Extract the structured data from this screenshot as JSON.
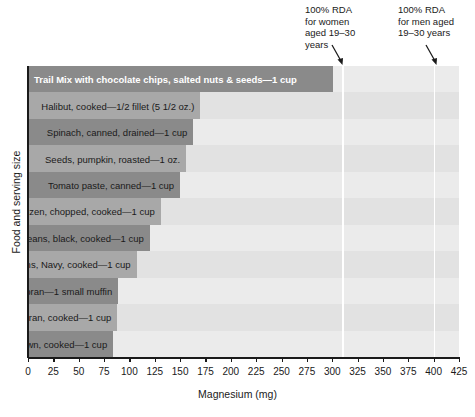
{
  "chart_data": {
    "type": "bar",
    "orientation": "horizontal",
    "title": "",
    "xlabel": "Magnesium (mg)",
    "ylabel": "Food and serving size",
    "xlim": [
      0,
      425
    ],
    "xticks": [
      0,
      25,
      50,
      75,
      100,
      125,
      150,
      175,
      200,
      225,
      250,
      275,
      300,
      325,
      350,
      375,
      400,
      425
    ],
    "grid": false,
    "legend": "none",
    "categories": [
      "Trail Mix with chocolate chips, salted nuts & seeds—1 cup",
      "Halibut, cooked—1/2 fillet (5 1/2 oz.)",
      "Spinach, canned, drained—1 cup",
      "Seeds, pumpkin, roasted—1 oz.",
      "Tomato paste, canned—1 cup",
      "Spinach, frozen, chopped, cooked—1 cup",
      "Beans, black, cooked—1 cup",
      "Beans, Navy, cooked—1 cup",
      "Muffins, oat bran—1 small muffin",
      "Oat bran, cooked—1 cup",
      "Rice, brown, cooked—1 cup"
    ],
    "values": [
      301,
      170,
      163,
      156,
      150,
      131,
      120,
      107,
      89,
      88,
      84
    ],
    "bar_colors": [
      "dark",
      "light",
      "dark",
      "light",
      "dark",
      "light",
      "dark",
      "light",
      "dark",
      "light",
      "dark"
    ],
    "label_placement": [
      "inside",
      "outside",
      "outside",
      "outside",
      "outside",
      "outside",
      "outside",
      "outside",
      "outside",
      "outside",
      "outside"
    ],
    "annotations": [
      {
        "id": "rda-women",
        "text": "100% RDA\nfor women\naged 19–30\nyears",
        "value": 310
      },
      {
        "id": "rda-men",
        "text": "100% RDA\nfor men aged\n19–30 years",
        "value": 400
      }
    ]
  }
}
